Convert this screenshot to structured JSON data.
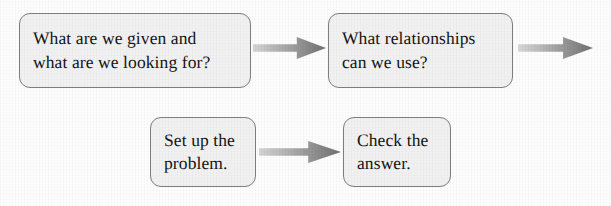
{
  "diagram": {
    "background_color": "#fdfdfd",
    "node_fill_color": "#f1f1f1",
    "node_border_color": "#7e7e7e",
    "text_color": "#141414",
    "arrow_color_start": "#cfcfcf",
    "arrow_color_end": "#6f6f6f",
    "nodes": [
      {
        "id": "given-and-looking-for",
        "label": "What are we given and\nwhat are we looking for?",
        "line1": "What are we given and",
        "line2": "what are we looking for?",
        "x": 19,
        "y": 13,
        "width": 232,
        "height": 75
      },
      {
        "id": "relationships",
        "label": "What relationships\ncan we use?",
        "line1": "What relationships",
        "line2": "can we use?",
        "x": 328,
        "y": 13,
        "width": 185,
        "height": 75
      },
      {
        "id": "set-up-problem",
        "label": "Set up the\nproblem.",
        "line1": "Set up the",
        "line2": "problem.",
        "x": 150,
        "y": 117,
        "width": 106,
        "height": 70
      },
      {
        "id": "check-answer",
        "label": "Check the\nanswer.",
        "line1": "Check the",
        "line2": "answer.",
        "x": 343,
        "y": 117,
        "width": 108,
        "height": 70
      }
    ],
    "arrows": [
      {
        "id": "arrow-given-to-relationships",
        "from": "given-and-looking-for",
        "to": "relationships",
        "x": 253,
        "y": 33,
        "width": 73,
        "height": 30,
        "direction": "right"
      },
      {
        "id": "arrow-relationships-onward",
        "from": "relationships",
        "to": "",
        "x": 518,
        "y": 33,
        "width": 75,
        "height": 30,
        "direction": "right"
      },
      {
        "id": "arrow-setup-to-check",
        "from": "set-up-problem",
        "to": "check-answer",
        "x": 259,
        "y": 137,
        "width": 82,
        "height": 30,
        "direction": "right"
      }
    ]
  }
}
